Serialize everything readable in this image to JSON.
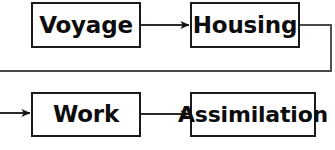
{
  "diagram": {
    "type": "flow-diagram",
    "orientation": "horizontal-wrapped",
    "background_color": "#ffffff",
    "line_color": "#1a1a1a",
    "text_color": "#0d0d0d",
    "nodes": [
      {
        "id": "voyage",
        "label": "Voyage",
        "row": 1,
        "order": 1
      },
      {
        "id": "housing",
        "label": "Housing",
        "row": 1,
        "order": 2
      },
      {
        "id": "work",
        "label": "Work",
        "row": 2,
        "order": 1
      },
      {
        "id": "assimilation",
        "label": "Assimilation",
        "row": 2,
        "order": 2
      }
    ],
    "connectors": [
      {
        "id": "voyage-to-housing",
        "from": "voyage",
        "to": "housing",
        "style": "straight-arrow"
      },
      {
        "id": "housing-to-work",
        "from": "housing",
        "to": "work",
        "style": "wrapped-elbow-arrow"
      },
      {
        "id": "work-to-assimilation",
        "from": "work",
        "to": "assimilation",
        "style": "straight-arrow"
      }
    ]
  }
}
